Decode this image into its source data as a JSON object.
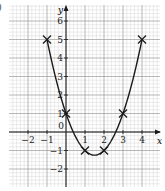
{
  "part_label": ")",
  "chart_data": {
    "type": "line",
    "title": "",
    "xlabel": "x",
    "ylabel": "y",
    "xlim": [
      -3,
      4.3
    ],
    "ylim": [
      -3.0,
      6.8
    ],
    "x_ticks": [
      -2,
      -1,
      0,
      1,
      2,
      3,
      4
    ],
    "x_tick_labels": [
      "−2",
      "−1",
      "0",
      "1",
      "2",
      "3",
      "4"
    ],
    "y_ticks": [
      -2,
      -1,
      1,
      2,
      3,
      4,
      5,
      6
    ],
    "y_tick_labels": [
      "−2",
      "−1",
      "1",
      "2",
      "3",
      "4",
      "5",
      "6"
    ],
    "grid": true,
    "minor_grid_step": 0.2,
    "equation": "y = x^2 - 3x + 1",
    "series": [
      {
        "name": "y = x² − 3x + 1",
        "x": [
          -1,
          0,
          1,
          2,
          3,
          4
        ],
        "y": [
          5,
          1,
          -1,
          -1,
          1,
          5
        ],
        "marker": "x",
        "curve_domain": [
          -1,
          4
        ],
        "minimum": {
          "x": 1.5,
          "y": -1.25
        }
      }
    ],
    "colors": {
      "curve": "#1a1a1a",
      "grid_major": "#9a9a9a",
      "grid_minor": "#cfcfcf",
      "axis": "#1a1a1a"
    }
  },
  "layout": {
    "origin_px": [
      66,
      132
    ],
    "unit_x_px": 19,
    "unit_y_px": 18.5,
    "grid_left_px": 9,
    "grid_right_px": 160,
    "grid_top_px": 5,
    "grid_bottom_px": 187
  }
}
